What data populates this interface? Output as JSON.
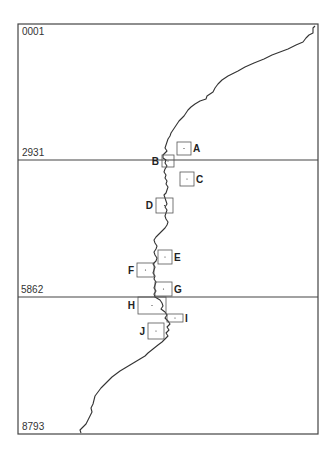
{
  "figure": {
    "row_labels": [
      "0001",
      "2931",
      "5862",
      "8793"
    ],
    "colors": {
      "line": "#333333",
      "frame": "#444444",
      "box": "#555555"
    },
    "frame": {
      "left": 18,
      "top": 24,
      "right": 318,
      "bottom": 434
    },
    "dividers_y": [
      160,
      297
    ],
    "trace_points": [
      [
        315,
        26
      ],
      [
        313,
        28
      ],
      [
        313,
        33
      ],
      [
        309,
        35
      ],
      [
        306,
        38
      ],
      [
        303,
        42
      ],
      [
        296,
        45
      ],
      [
        288,
        49
      ],
      [
        280,
        52
      ],
      [
        272,
        55
      ],
      [
        264,
        59
      ],
      [
        254,
        63
      ],
      [
        245,
        67
      ],
      [
        238,
        71
      ],
      [
        234,
        73
      ],
      [
        228,
        76
      ],
      [
        222,
        80
      ],
      [
        218,
        84
      ],
      [
        215,
        88
      ],
      [
        213,
        92
      ],
      [
        210,
        94
      ],
      [
        207,
        96
      ],
      [
        206,
        99
      ],
      [
        203,
        100
      ],
      [
        200,
        101
      ],
      [
        195,
        104
      ],
      [
        191,
        107
      ],
      [
        188,
        110
      ],
      [
        186,
        113
      ],
      [
        184,
        116
      ],
      [
        181,
        119
      ],
      [
        179,
        121
      ],
      [
        177,
        124
      ],
      [
        175,
        127
      ],
      [
        173,
        130
      ],
      [
        171,
        133
      ],
      [
        170,
        136
      ],
      [
        168,
        139
      ],
      [
        167,
        142
      ],
      [
        166,
        145
      ],
      [
        165,
        148
      ],
      [
        167,
        151
      ],
      [
        165,
        153
      ],
      [
        163,
        155
      ],
      [
        163,
        158
      ],
      [
        166,
        160
      ],
      [
        165,
        163
      ],
      [
        167,
        166
      ],
      [
        165,
        169
      ],
      [
        164,
        172
      ],
      [
        166,
        175
      ],
      [
        165,
        178
      ],
      [
        167,
        181
      ],
      [
        166,
        184
      ],
      [
        168,
        187
      ],
      [
        167,
        190
      ],
      [
        166,
        193
      ],
      [
        164,
        195
      ],
      [
        165,
        198
      ],
      [
        166,
        201
      ],
      [
        167,
        204
      ],
      [
        165,
        207
      ],
      [
        167,
        210
      ],
      [
        166,
        213
      ],
      [
        165,
        216
      ],
      [
        166,
        219
      ],
      [
        168,
        222
      ],
      [
        167,
        225
      ],
      [
        165,
        228
      ],
      [
        162,
        231
      ],
      [
        159,
        234
      ],
      [
        156,
        237
      ],
      [
        154,
        240
      ],
      [
        155,
        243
      ],
      [
        157,
        246
      ],
      [
        156,
        249
      ],
      [
        154,
        252
      ],
      [
        155,
        255
      ],
      [
        157,
        258
      ],
      [
        156,
        261
      ],
      [
        153,
        264
      ],
      [
        155,
        267
      ],
      [
        154,
        270
      ],
      [
        153,
        273
      ],
      [
        155,
        276
      ],
      [
        154,
        279
      ],
      [
        156,
        282
      ],
      [
        155,
        285
      ],
      [
        154,
        288
      ],
      [
        156,
        291
      ],
      [
        154,
        294
      ],
      [
        155,
        297
      ],
      [
        160,
        300
      ],
      [
        162,
        303
      ],
      [
        163,
        306
      ],
      [
        161,
        309
      ],
      [
        165,
        312
      ],
      [
        167,
        315
      ],
      [
        165,
        318
      ],
      [
        168,
        321
      ],
      [
        170,
        324
      ],
      [
        167,
        327
      ],
      [
        169,
        330
      ],
      [
        166,
        333
      ],
      [
        168,
        336
      ],
      [
        165,
        339
      ],
      [
        162,
        342
      ],
      [
        158,
        345
      ],
      [
        153,
        349
      ],
      [
        148,
        353
      ],
      [
        145,
        356
      ],
      [
        140,
        359
      ],
      [
        135,
        362
      ],
      [
        130,
        365
      ],
      [
        125,
        368
      ],
      [
        120,
        371
      ],
      [
        116,
        374
      ],
      [
        112,
        377
      ],
      [
        108,
        381
      ],
      [
        104,
        385
      ],
      [
        101,
        388
      ],
      [
        98,
        392
      ],
      [
        95,
        396
      ],
      [
        94,
        400
      ],
      [
        93,
        404
      ],
      [
        91,
        408
      ],
      [
        92,
        412
      ],
      [
        90,
        416
      ],
      [
        88,
        420
      ],
      [
        86,
        424
      ],
      [
        83,
        427
      ],
      [
        80,
        430
      ],
      [
        81,
        433
      ]
    ],
    "boxes": [
      {
        "label": "A",
        "x": 177,
        "y": 142,
        "w": 14,
        "h": 13,
        "label_side": "right"
      },
      {
        "label": "B",
        "x": 162,
        "y": 155,
        "w": 12,
        "h": 12,
        "label_side": "left"
      },
      {
        "label": "C",
        "x": 180,
        "y": 172,
        "w": 14,
        "h": 14,
        "label_side": "right"
      },
      {
        "label": "D",
        "x": 156,
        "y": 198,
        "w": 17,
        "h": 15,
        "label_side": "left"
      },
      {
        "label": "E",
        "x": 158,
        "y": 250,
        "w": 14,
        "h": 14,
        "label_side": "right"
      },
      {
        "label": "F",
        "x": 137,
        "y": 263,
        "w": 17,
        "h": 14,
        "label_side": "left"
      },
      {
        "label": "G",
        "x": 155,
        "y": 282,
        "w": 17,
        "h": 14,
        "label_side": "right"
      },
      {
        "label": "H",
        "x": 138,
        "y": 297,
        "w": 28,
        "h": 17,
        "label_side": "left"
      },
      {
        "label": "I",
        "x": 167,
        "y": 314,
        "w": 16,
        "h": 8,
        "label_side": "right"
      },
      {
        "label": "J",
        "x": 148,
        "y": 323,
        "w": 16,
        "h": 16,
        "label_side": "left"
      }
    ]
  }
}
